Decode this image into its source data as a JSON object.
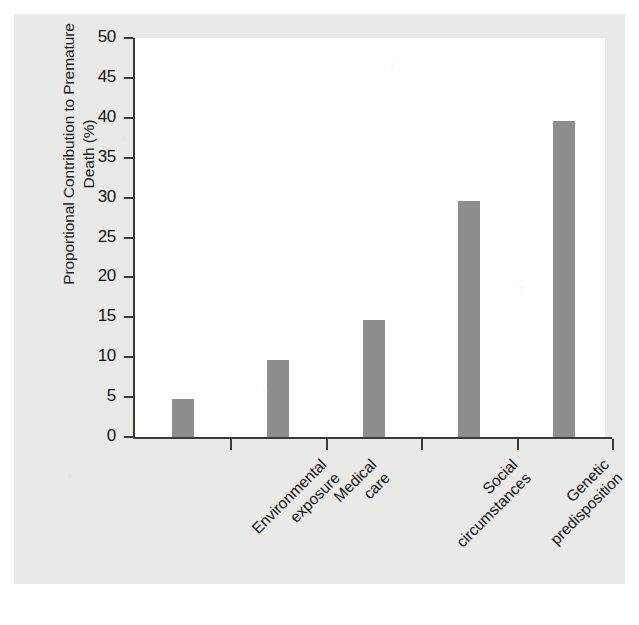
{
  "figure": {
    "background_color": "#e9e9e7",
    "plot_background_color": "#fefefe",
    "axis_color": "#3a3a3a",
    "bar_color": "#8d8d8d"
  },
  "axes": {
    "y_title_line1": "Proportional Contribution to Premature",
    "y_title_line2": "Death (%)",
    "y_title": "Proportional Contribution to Premature\nDeath (%)",
    "y_ticks": [
      "0",
      "5",
      "10",
      "15",
      "20",
      "25",
      "30",
      "35",
      "40",
      "45",
      "50"
    ]
  },
  "categories_display": [
    "Environmental\nexposure",
    "Medical\ncare",
    "Social\ncircumstances",
    "Genetic\npredisposition",
    "Behavioral\npatterns"
  ],
  "chart_data": {
    "type": "bar",
    "title": "",
    "subtitle": "",
    "xlabel": "",
    "ylabel": "Proportional Contribution to Premature Death (%)",
    "categories": [
      "Environmental exposure",
      "Medical care",
      "Social circumstances",
      "Genetic predisposition",
      "Behavioral patterns"
    ],
    "values": [
      4.8,
      9.7,
      14.7,
      29.6,
      39.6
    ],
    "ylim": [
      0,
      50
    ],
    "ytick_step": 5,
    "yticks": [
      0,
      5,
      10,
      15,
      20,
      25,
      30,
      35,
      40,
      45,
      50
    ],
    "grid": false,
    "legend": null,
    "bar_color": "#8d8d8d",
    "orientation": "vertical"
  }
}
